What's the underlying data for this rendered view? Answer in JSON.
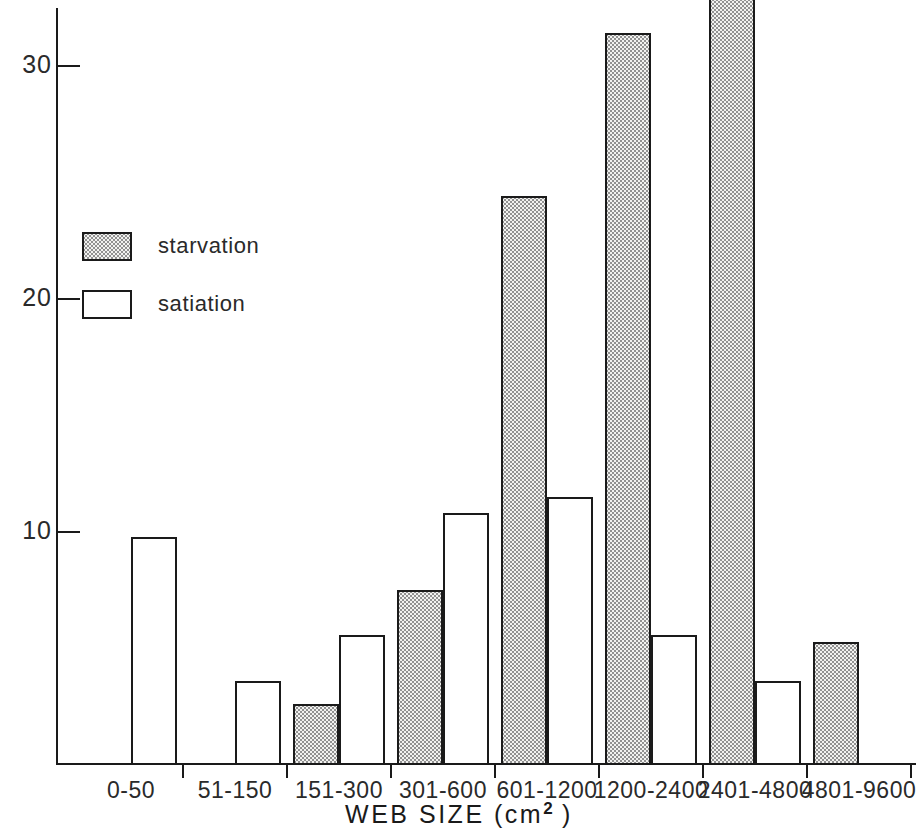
{
  "chart_data": {
    "type": "bar",
    "title": "",
    "subtitle": "",
    "xlabel": "WEB SIZE (cm2)",
    "xlabel_base": "WEB SIZE (cm",
    "xlabel_sup": "2",
    "xlabel_tail": " )",
    "ylabel": "",
    "ylim": [
      0,
      34
    ],
    "y_ticks": [
      10,
      20,
      30
    ],
    "y_tick_labels": [
      "10",
      "20",
      "30"
    ],
    "grid": false,
    "legend_position": "upper-left-inside",
    "categories": [
      "0-50",
      "51-150",
      "151-300",
      "301-600",
      "601-1200",
      "1200-2400",
      "2401-4800",
      "4801-9600"
    ],
    "series": [
      {
        "name": "starvation",
        "fill": "stippled",
        "color": "#f2f2f0",
        "values": [
          0,
          0,
          2.6,
          7.5,
          24.4,
          31.4,
          33.0,
          5.3
        ]
      },
      {
        "name": "satiation",
        "fill": "white",
        "color": "#ffffff",
        "values": [
          9.8,
          3.6,
          5.6,
          10.8,
          11.5,
          5.6,
          3.6,
          0
        ]
      }
    ]
  },
  "legend": {
    "items": [
      {
        "label": "starvation",
        "style": "starvation"
      },
      {
        "label": "satiation",
        "style": "satiation"
      }
    ]
  },
  "axis_colors": {
    "line": "#1a1a1a",
    "text": "#2a2a2a",
    "bar_outline": "#1a1a1a",
    "stipple": "#8a8a8a"
  }
}
